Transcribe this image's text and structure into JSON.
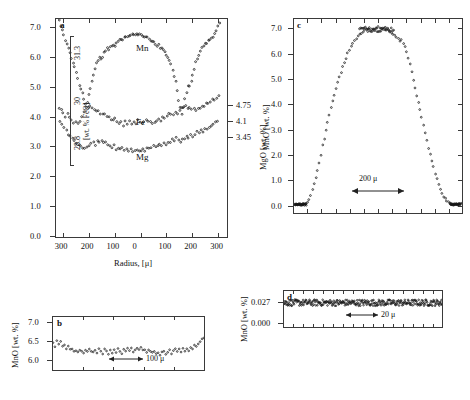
{
  "figure": {
    "panels": [
      "a",
      "b",
      "c",
      "d"
    ]
  },
  "panel_a": {
    "label": "a",
    "xlabel": "Radius, [μ]",
    "xticks": [
      "300",
      "200",
      "100",
      "0",
      "100",
      "200",
      "300"
    ],
    "ylabel_left_main": "",
    "yticks_left_main": [
      "0.0",
      "1.0",
      "2.0",
      "3.0",
      "4.0",
      "5.0",
      "6.0",
      "7.0"
    ],
    "ylabel_left_inner": "[wt. % FeO]",
    "yticks_left_inner": [
      "28.8",
      "30.0",
      "31.3"
    ],
    "ylabel_right": "MgO [wt. %]",
    "yticks_right": [
      "3.45",
      "4.1",
      "4.75"
    ],
    "curve_labels": [
      "Mn",
      "Fe",
      "Mg"
    ]
  },
  "panel_b": {
    "label": "b",
    "ylabel": "MnO [wt. %]",
    "yticks": [
      "6.0",
      "6.5",
      "7.0"
    ],
    "scalebar": "100 μ"
  },
  "panel_c": {
    "label": "c",
    "ylabel": "MnO [wt. %]",
    "yticks": [
      "0.0",
      "1.0",
      "2.0",
      "3.0",
      "4.0",
      "5.0",
      "6.0",
      "7.0"
    ],
    "scalebar": "200 μ"
  },
  "panel_d": {
    "label": "d",
    "ylabel": "MnO [wt. %]",
    "yticks": [
      "0.000",
      "0.027"
    ],
    "scalebar": "20 μ"
  },
  "chart_data": [
    {
      "type": "scatter",
      "id": "panel_a",
      "title": "a",
      "xlabel": "Radius, [μ]",
      "ylabel": "MnO [wt. %]",
      "xlim": [
        -330,
        330
      ],
      "ylim": [
        0.0,
        7.3
      ],
      "xtick_values": [
        -300,
        -200,
        -100,
        0,
        100,
        200,
        300
      ],
      "xtick_labels": [
        "300",
        "200",
        "100",
        "0",
        "100",
        "200",
        "300"
      ],
      "ytick_values": [
        0.0,
        1.0,
        2.0,
        3.0,
        4.0,
        5.0,
        6.0,
        7.0
      ],
      "secondary_axis_left": {
        "label": "[wt. % FeO]",
        "ticks": [
          28.8,
          30.0,
          31.3
        ],
        "maps_to_mn": [
          3.35,
          4.85,
          6.35
        ]
      },
      "secondary_axis_right": {
        "label": "MgO [wt. %]",
        "ticks": [
          3.45,
          4.1,
          4.75
        ],
        "maps_to_mn": [
          3.3,
          3.85,
          4.4
        ]
      },
      "grid": false,
      "series": [
        {
          "name": "Mn",
          "x": [
            -318,
            -312,
            -306,
            -300,
            -294,
            -288,
            -282,
            -276,
            -270,
            -264,
            -258,
            -252,
            -246,
            -240,
            -234,
            -228,
            -222,
            -216,
            -210,
            -204,
            -198,
            -192,
            -186,
            -180,
            -174,
            -168,
            -162,
            -156,
            -150,
            -144,
            -138,
            -132,
            -126,
            -120,
            -114,
            -108,
            -102,
            -96,
            -90,
            -84,
            -78,
            -72,
            -66,
            -60,
            -54,
            -48,
            -42,
            -36,
            -30,
            -24,
            -18,
            -12,
            -6,
            0,
            6,
            12,
            18,
            24,
            30,
            36,
            42,
            48,
            54,
            60,
            66,
            72,
            78,
            84,
            90,
            96,
            102,
            108,
            114,
            120,
            126,
            132,
            138,
            144,
            150,
            156,
            162,
            168,
            174,
            180,
            186,
            192,
            198,
            204,
            210,
            216,
            222,
            228,
            234,
            240,
            246,
            252,
            258,
            264,
            270,
            276,
            282,
            288,
            294,
            300
          ],
          "y": [
            7.25,
            7.1,
            6.95,
            6.8,
            6.6,
            6.45,
            6.3,
            6.15,
            6.0,
            5.85,
            5.7,
            5.5,
            5.3,
            5.1,
            4.95,
            4.8,
            4.6,
            4.45,
            4.5,
            4.75,
            5.0,
            5.2,
            5.45,
            5.6,
            5.8,
            5.9,
            6.0,
            5.95,
            6.05,
            6.15,
            6.2,
            6.3,
            6.25,
            6.35,
            6.4,
            6.45,
            6.4,
            6.5,
            6.55,
            6.6,
            6.65,
            6.6,
            6.7,
            6.72,
            6.7,
            6.75,
            6.78,
            6.8,
            6.78,
            6.8,
            6.82,
            6.8,
            6.78,
            6.8,
            6.75,
            6.72,
            6.7,
            6.68,
            6.65,
            6.6,
            6.58,
            6.5,
            6.45,
            6.4,
            6.45,
            6.35,
            6.3,
            6.25,
            6.2,
            6.1,
            6.0,
            5.9,
            5.8,
            5.6,
            5.4,
            5.2,
            4.9,
            4.6,
            4.3,
            4.1,
            4.3,
            4.6,
            4.85,
            5.05,
            5.05,
            5.2,
            5.45,
            5.65,
            5.85,
            6.0,
            6.1,
            6.25,
            6.35,
            6.4,
            6.5,
            6.45,
            6.55,
            6.6,
            6.65,
            6.7,
            6.8,
            6.9,
            7.05,
            7.2
          ]
        },
        {
          "name": "Fe",
          "x": [
            -318,
            -310,
            -302,
            -294,
            -286,
            -278,
            -270,
            -262,
            -254,
            -246,
            -238,
            -230,
            -222,
            -214,
            -206,
            -198,
            -190,
            -182,
            -174,
            -166,
            -158,
            -150,
            -142,
            -134,
            -126,
            -118,
            -110,
            -102,
            -94,
            -86,
            -78,
            -70,
            -62,
            -54,
            -46,
            -38,
            -30,
            -22,
            -14,
            -6,
            2,
            10,
            18,
            26,
            34,
            42,
            50,
            58,
            66,
            74,
            82,
            90,
            98,
            106,
            114,
            122,
            130,
            138,
            146,
            154,
            162,
            170,
            178,
            186,
            194,
            202,
            210,
            218,
            226,
            234,
            242,
            250,
            258,
            266,
            274,
            282,
            290,
            298
          ],
          "y": [
            4.3,
            4.25,
            4.15,
            4.05,
            4.1,
            4.0,
            3.95,
            3.85,
            3.9,
            3.8,
            3.9,
            4.05,
            4.2,
            4.3,
            4.35,
            4.4,
            4.35,
            4.3,
            4.25,
            4.2,
            4.15,
            4.1,
            4.15,
            4.05,
            4.0,
            3.95,
            3.9,
            3.95,
            3.85,
            3.8,
            3.85,
            3.75,
            3.85,
            3.8,
            3.9,
            3.75,
            3.85,
            3.8,
            3.9,
            3.85,
            3.8,
            3.9,
            3.95,
            3.85,
            3.9,
            3.8,
            3.85,
            3.9,
            3.95,
            3.9,
            4.0,
            3.95,
            4.05,
            4.1,
            4.15,
            4.1,
            4.2,
            4.15,
            4.25,
            4.3,
            4.35,
            4.4,
            4.3,
            4.35,
            4.25,
            4.3,
            4.2,
            4.3,
            4.35,
            4.4,
            4.35,
            4.45,
            4.5,
            4.55,
            4.6,
            4.55,
            4.65,
            4.7
          ]
        },
        {
          "name": "Mg",
          "x": [
            -314,
            -306,
            -298,
            -290,
            -282,
            -274,
            -266,
            -258,
            -250,
            -242,
            -234,
            -226,
            -218,
            -210,
            -202,
            -194,
            -186,
            -178,
            -170,
            -162,
            -154,
            -146,
            -138,
            -130,
            -122,
            -114,
            -106,
            -98,
            -90,
            -82,
            -74,
            -66,
            -58,
            -50,
            -42,
            -34,
            -26,
            -18,
            -10,
            -2,
            6,
            14,
            22,
            30,
            38,
            46,
            54,
            62,
            70,
            78,
            86,
            94,
            102,
            110,
            118,
            126,
            134,
            142,
            150,
            158,
            166,
            174,
            182,
            190,
            198,
            206,
            214,
            222,
            230,
            238,
            246,
            254,
            262,
            270,
            278,
            286,
            294
          ],
          "y": [
            3.85,
            3.75,
            3.65,
            3.55,
            3.45,
            3.4,
            3.3,
            3.2,
            3.15,
            3.1,
            3.05,
            3.0,
            2.95,
            3.0,
            3.05,
            3.1,
            3.15,
            3.1,
            3.2,
            3.15,
            3.25,
            3.2,
            3.15,
            3.1,
            3.05,
            3.0,
            3.05,
            2.95,
            3.0,
            2.95,
            3.0,
            2.9,
            2.95,
            2.9,
            2.95,
            2.85,
            2.9,
            2.95,
            2.85,
            2.9,
            2.95,
            2.9,
            2.95,
            3.0,
            2.95,
            3.05,
            3.0,
            3.05,
            3.1,
            3.05,
            3.15,
            3.1,
            3.2,
            3.15,
            3.25,
            3.2,
            3.3,
            3.25,
            3.2,
            3.3,
            3.25,
            3.35,
            3.3,
            3.4,
            3.35,
            3.45,
            3.5,
            3.45,
            3.55,
            3.5,
            3.6,
            3.65,
            3.7,
            3.75,
            3.8,
            3.85,
            3.9
          ]
        }
      ]
    },
    {
      "type": "scatter",
      "id": "panel_b",
      "title": "b",
      "xlabel": "",
      "ylabel": "MnO [wt. %]",
      "ylim": [
        5.75,
        7.15
      ],
      "ytick_values": [
        6.0,
        6.5,
        7.0
      ],
      "scalebar": "100 μ",
      "grid": false,
      "x": [
        0,
        1,
        2,
        3,
        4,
        5,
        6,
        7,
        8,
        9,
        10,
        11,
        12,
        13,
        14,
        15,
        16,
        17,
        18,
        19,
        20,
        21,
        22,
        23,
        24,
        25,
        26,
        27,
        28,
        29,
        30,
        31,
        32,
        33,
        34,
        35,
        36,
        37,
        38,
        39,
        40,
        41,
        42,
        43,
        44,
        45,
        46,
        47,
        48,
        49,
        50,
        51,
        52,
        53,
        54,
        55,
        56,
        57,
        58,
        59,
        60,
        61,
        62,
        63,
        64,
        65,
        66,
        67,
        68,
        69,
        70,
        71,
        72,
        73,
        74,
        75,
        76,
        77,
        78,
        79
      ],
      "y": [
        6.45,
        6.38,
        6.55,
        6.42,
        6.48,
        6.35,
        6.4,
        6.33,
        6.38,
        6.28,
        6.3,
        6.25,
        6.28,
        6.22,
        6.3,
        6.24,
        6.2,
        6.26,
        6.22,
        6.3,
        6.24,
        6.2,
        6.28,
        6.22,
        6.3,
        6.25,
        6.2,
        6.3,
        6.24,
        6.18,
        6.26,
        6.2,
        6.28,
        6.22,
        6.3,
        6.25,
        6.2,
        6.28,
        6.23,
        6.3,
        6.26,
        6.32,
        6.25,
        6.3,
        6.35,
        6.28,
        6.33,
        6.26,
        6.3,
        6.24,
        6.3,
        6.25,
        6.2,
        6.25,
        6.18,
        6.22,
        6.15,
        6.2,
        6.25,
        6.18,
        6.22,
        6.28,
        6.2,
        6.25,
        6.3,
        6.22,
        6.28,
        6.24,
        6.3,
        6.26,
        6.32,
        6.28,
        6.35,
        6.3,
        6.38,
        6.35,
        6.42,
        6.48,
        6.55,
        6.6
      ]
    },
    {
      "type": "scatter",
      "id": "panel_c",
      "title": "c",
      "xlabel": "",
      "ylabel": "MnO [wt. %]",
      "ylim": [
        -0.25,
        7.4
      ],
      "ytick_values": [
        0.0,
        1.0,
        2.0,
        3.0,
        4.0,
        5.0,
        6.0,
        7.0
      ],
      "scalebar": "200 μ",
      "grid": false,
      "x": [
        0,
        2,
        4,
        6,
        8,
        10,
        12,
        14,
        16,
        18,
        20,
        22,
        24,
        26,
        28,
        30,
        32,
        34,
        36,
        38,
        40,
        42,
        44,
        46,
        48,
        50,
        52,
        54,
        56,
        58,
        60,
        62,
        64,
        66,
        68,
        70,
        72,
        74,
        76,
        78,
        80,
        82,
        84,
        86,
        88,
        90,
        92,
        94,
        96,
        98,
        100,
        102,
        104,
        106,
        108,
        110,
        112,
        114,
        116,
        118,
        120,
        122,
        124,
        126,
        128,
        130,
        132,
        134,
        136,
        138,
        140,
        142,
        144,
        146,
        148,
        150,
        152,
        154,
        156,
        158,
        160,
        162,
        164,
        166,
        168,
        170,
        172,
        174,
        176,
        178,
        180,
        182,
        184,
        186,
        188,
        190,
        192,
        194,
        196,
        198,
        200
      ],
      "y": [
        0.08,
        0.08,
        0.08,
        0.09,
        0.09,
        0.1,
        0.12,
        0.15,
        0.2,
        0.3,
        0.45,
        0.65,
        0.9,
        1.15,
        1.45,
        1.75,
        2.05,
        2.4,
        2.7,
        3.0,
        3.3,
        3.6,
        3.9,
        4.15,
        4.4,
        4.65,
        4.9,
        5.1,
        5.3,
        5.5,
        5.7,
        5.85,
        6.05,
        6.2,
        6.35,
        6.45,
        6.55,
        6.65,
        6.7,
        6.78,
        6.85,
        6.9,
        6.95,
        7.0,
        7.02,
        7.05,
        7.03,
        7.0,
        7.02,
        7.05,
        7.08,
        7.05,
        7.03,
        7.05,
        7.0,
        6.98,
        6.95,
        6.9,
        6.85,
        6.8,
        6.75,
        6.68,
        6.6,
        6.55,
        6.6,
        6.45,
        6.3,
        6.1,
        5.85,
        5.6,
        5.3,
        5.0,
        4.7,
        4.4,
        4.1,
        3.8,
        3.5,
        3.2,
        2.9,
        2.6,
        2.3,
        2.05,
        1.8,
        1.55,
        1.3,
        1.1,
        0.9,
        0.7,
        0.55,
        0.4,
        0.3,
        0.22,
        0.16,
        0.12,
        0.1,
        0.09,
        0.09,
        0.09,
        0.1,
        0.1,
        0.12
      ]
    },
    {
      "type": "scatter",
      "id": "panel_d",
      "title": "d",
      "xlabel": "",
      "ylabel": "MnO [wt. %]",
      "ylim": [
        -0.004,
        0.042
      ],
      "ytick_values": [
        0.0,
        0.027
      ],
      "ytick_labels": [
        "0.000",
        "0.027"
      ],
      "scalebar": "20 μ",
      "grid": false,
      "noise_center": 0.027,
      "noise_amplitude": 0.004
    }
  ]
}
